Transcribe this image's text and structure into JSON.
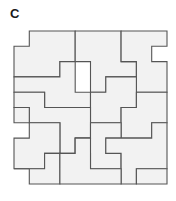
{
  "figure": {
    "label": "C",
    "caption_letter": "C",
    "kind": "polyomino-tiling-diagram",
    "colors": {
      "tile_fill": "#f2f2f2",
      "tile_stroke": "#555555",
      "background": "#ffffff",
      "label_color": "#1a1a1a"
    },
    "geometry": {
      "origin_x": 14,
      "origin_y": 31,
      "module_px": 15.3,
      "grid_units": 10,
      "stroke_width": 1.1,
      "tile_count": 20
    },
    "tiles": [
      {
        "id": "t1",
        "points": [
          [
            0,
            1
          ],
          [
            1,
            1
          ],
          [
            1,
            0
          ],
          [
            4,
            0
          ],
          [
            4,
            2
          ],
          [
            3,
            2
          ],
          [
            3,
            3
          ],
          [
            0,
            3
          ]
        ]
      },
      {
        "id": "t2",
        "points": [
          [
            4,
            0
          ],
          [
            7,
            0
          ],
          [
            7,
            2
          ],
          [
            8,
            2
          ],
          [
            8,
            3
          ],
          [
            6,
            3
          ],
          [
            6,
            4
          ],
          [
            5,
            4
          ],
          [
            5,
            2
          ],
          [
            4,
            2
          ]
        ]
      },
      {
        "id": "t3",
        "points": [
          [
            7,
            0
          ],
          [
            10,
            0
          ],
          [
            10,
            1
          ],
          [
            9,
            1
          ],
          [
            9,
            2
          ],
          [
            10,
            2
          ],
          [
            10,
            4
          ],
          [
            8,
            4
          ],
          [
            8,
            2
          ],
          [
            7,
            2
          ]
        ]
      },
      {
        "id": "t4",
        "points": [
          [
            0,
            3
          ],
          [
            3,
            3
          ],
          [
            3,
            2
          ],
          [
            4,
            2
          ],
          [
            4,
            4
          ],
          [
            5,
            4
          ],
          [
            5,
            5
          ],
          [
            2,
            5
          ],
          [
            2,
            4
          ],
          [
            0,
            4
          ]
        ]
      },
      {
        "id": "t5",
        "points": [
          [
            5,
            4
          ],
          [
            6,
            4
          ],
          [
            6,
            3
          ],
          [
            8,
            3
          ],
          [
            8,
            5
          ],
          [
            7,
            5
          ],
          [
            7,
            6
          ],
          [
            5,
            6
          ]
        ]
      },
      {
        "id": "t6",
        "points": [
          [
            8,
            4
          ],
          [
            10,
            4
          ],
          [
            10,
            6
          ],
          [
            9,
            6
          ],
          [
            9,
            7
          ],
          [
            7,
            7
          ],
          [
            7,
            5
          ],
          [
            8,
            5
          ]
        ]
      },
      {
        "id": "t7",
        "points": [
          [
            2,
            4
          ],
          [
            2,
            5
          ],
          [
            5,
            5
          ],
          [
            5,
            7
          ],
          [
            4,
            7
          ],
          [
            4,
            8
          ],
          [
            3,
            8
          ],
          [
            3,
            6
          ],
          [
            1,
            6
          ],
          [
            1,
            5
          ],
          [
            0,
            5
          ],
          [
            0,
            4
          ]
        ]
      },
      {
        "id": "t8",
        "points": [
          [
            5,
            6
          ],
          [
            7,
            6
          ],
          [
            7,
            7
          ],
          [
            6,
            7
          ],
          [
            6,
            8
          ],
          [
            7,
            8
          ],
          [
            7,
            9
          ],
          [
            5,
            9
          ],
          [
            5,
            8
          ],
          [
            4,
            8
          ],
          [
            4,
            7
          ],
          [
            5,
            7
          ]
        ]
      },
      {
        "id": "t9",
        "points": [
          [
            0,
            5
          ],
          [
            1,
            5
          ],
          [
            1,
            6
          ],
          [
            3,
            6
          ],
          [
            3,
            8
          ],
          [
            2,
            8
          ],
          [
            2,
            9
          ],
          [
            0,
            9
          ],
          [
            0,
            7
          ],
          [
            1,
            7
          ],
          [
            1,
            6
          ],
          [
            0,
            6
          ]
        ]
      },
      {
        "id": "t10",
        "points": [
          [
            7,
            7
          ],
          [
            9,
            7
          ],
          [
            9,
            6
          ],
          [
            10,
            6
          ],
          [
            10,
            9
          ],
          [
            8,
            9
          ],
          [
            8,
            10
          ],
          [
            7,
            10
          ],
          [
            7,
            8
          ],
          [
            6,
            8
          ],
          [
            6,
            7
          ]
        ]
      },
      {
        "id": "t11",
        "points": [
          [
            0,
            9
          ],
          [
            2,
            9
          ],
          [
            2,
            8
          ],
          [
            3,
            8
          ],
          [
            3,
            10
          ],
          [
            1,
            10
          ],
          [
            1,
            9
          ]
        ]
      },
      {
        "id": "t12",
        "points": [
          [
            3,
            8
          ],
          [
            4,
            8
          ],
          [
            4,
            7
          ],
          [
            5,
            7
          ],
          [
            5,
            9
          ],
          [
            7,
            9
          ],
          [
            7,
            10
          ],
          [
            3,
            10
          ]
        ]
      },
      {
        "id": "t13",
        "points": [
          [
            8,
            9
          ],
          [
            10,
            9
          ],
          [
            10,
            10
          ],
          [
            8,
            10
          ]
        ]
      }
    ],
    "outline": [
      [
        1,
        0
      ],
      [
        4,
        0
      ],
      [
        4,
        0
      ],
      [
        7,
        0
      ],
      [
        10,
        0
      ],
      [
        10,
        1
      ],
      [
        9,
        1
      ],
      [
        9,
        2
      ],
      [
        10,
        2
      ],
      [
        10,
        6
      ],
      [
        10,
        9
      ],
      [
        10,
        10
      ],
      [
        8,
        10
      ],
      [
        7,
        10
      ],
      [
        3,
        10
      ],
      [
        1,
        10
      ],
      [
        1,
        9
      ],
      [
        0,
        9
      ],
      [
        0,
        7
      ],
      [
        1,
        7
      ],
      [
        1,
        6
      ],
      [
        0,
        6
      ],
      [
        0,
        1
      ],
      [
        1,
        1
      ]
    ]
  }
}
